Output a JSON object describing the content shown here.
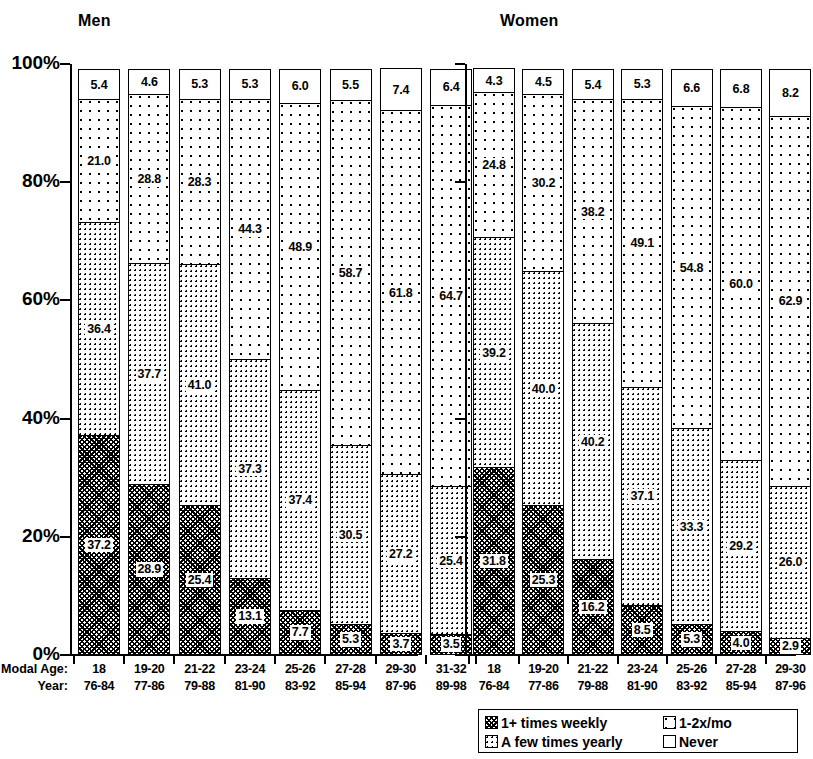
{
  "panels": [
    {
      "key": "men",
      "title": "Men"
    },
    {
      "key": "women",
      "title": "Women"
    }
  ],
  "axis": {
    "y_ticks": [
      "100%",
      "80%",
      "60%",
      "40%",
      "20%",
      "0%"
    ],
    "x_lead_age": "Modal Age:",
    "x_lead_year": "Year:"
  },
  "legend": {
    "items": [
      {
        "label": "1+ times weekly",
        "pattern": "p-weekly"
      },
      {
        "label": "1-2x/mo",
        "pattern": "p-12mo"
      },
      {
        "label": "A few times yearly",
        "pattern": "p-fewyear"
      },
      {
        "label": "Never",
        "pattern": "p-never"
      }
    ]
  },
  "chart_data": {
    "type": "bar",
    "subtype": "stacked-percentage",
    "xlabel": "Modal Age / Year",
    "ylabel": "",
    "ylim": [
      0,
      100
    ],
    "ytick_values": [
      0,
      20,
      40,
      60,
      80,
      100
    ],
    "ytick_labels": [
      "0%",
      "20%",
      "40%",
      "60%",
      "80%",
      "100%"
    ],
    "grid": false,
    "legend_position": "bottom-right",
    "categories": [
      "18",
      "19-20",
      "21-22",
      "23-24",
      "25-26",
      "27-28",
      "29-30",
      "31-32"
    ],
    "category_years": [
      "76-84",
      "77-86",
      "79-88",
      "81-90",
      "83-92",
      "85-94",
      "87-96",
      "89-98"
    ],
    "series_order_bottom_to_top": [
      "1+ times weekly",
      "A few times yearly",
      "1-2x/mo",
      "Never"
    ],
    "panels": [
      {
        "name": "Men",
        "series": [
          {
            "name": "1+ times weekly",
            "values": [
              37.2,
              28.9,
              25.4,
              13.1,
              7.7,
              5.3,
              3.7,
              3.5
            ]
          },
          {
            "name": "A few times yearly",
            "values": [
              36.4,
              37.7,
              41.0,
              37.3,
              37.4,
              30.5,
              27.2,
              25.4
            ]
          },
          {
            "name": "1-2x/mo",
            "values": [
              21.0,
              28.8,
              28.3,
              44.3,
              48.9,
              58.7,
              61.8,
              64.7
            ]
          },
          {
            "name": "Never",
            "values": [
              5.4,
              4.6,
              5.3,
              5.3,
              6.0,
              5.5,
              7.4,
              6.4
            ]
          }
        ]
      },
      {
        "name": "Women",
        "series": [
          {
            "name": "1+ times weekly",
            "values": [
              31.8,
              25.3,
              16.2,
              8.5,
              5.3,
              4.0,
              2.9,
              2.2
            ]
          },
          {
            "name": "A few times yearly",
            "values": [
              39.2,
              40.0,
              40.2,
              37.1,
              33.3,
              29.2,
              26.0,
              22.4
            ]
          },
          {
            "name": "1-2x/mo",
            "values": [
              24.8,
              30.2,
              38.2,
              49.1,
              54.8,
              60.0,
              62.9,
              65.9
            ]
          },
          {
            "name": "Never",
            "values": [
              4.3,
              4.5,
              5.4,
              5.3,
              6.6,
              6.8,
              8.2,
              9.5
            ]
          }
        ]
      }
    ]
  }
}
